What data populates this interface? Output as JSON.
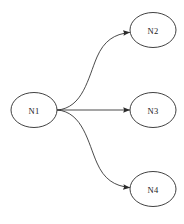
{
  "canvas": {
    "width": 184,
    "height": 224,
    "background_color": "#ffffff"
  },
  "diagram": {
    "type": "directed-graph",
    "stroke_color": "#2b2b2b",
    "label_color": "#1a1a1a",
    "node_fill": "none",
    "nodes": [
      {
        "id": "N1",
        "label": "N1",
        "cx": 34,
        "cy": 110,
        "rx": 23,
        "ry": 17.5
      },
      {
        "id": "N2",
        "label": "N2",
        "cx": 153,
        "cy": 30,
        "rx": 23,
        "ry": 17.5
      },
      {
        "id": "N3",
        "label": "N3",
        "cx": 153,
        "cy": 110,
        "rx": 23,
        "ry": 17.5
      },
      {
        "id": "N4",
        "label": "N4",
        "cx": 153,
        "cy": 189,
        "rx": 23,
        "ry": 17.5
      }
    ],
    "edges": [
      {
        "id": "edge-n1-n2",
        "from": "N1",
        "to": "N2",
        "shape": "curved",
        "path": "M 57.5,110 C 83,108 88,78 97,57 C 104,41 114,34 129.5,32.5",
        "arrow": {
          "x": 130,
          "y": 32.3,
          "angle": -6
        }
      },
      {
        "id": "edge-n1-n3",
        "from": "N1",
        "to": "N3",
        "shape": "straight",
        "path": "M 57.5,110 L 129.5,110",
        "arrow": {
          "x": 130,
          "y": 110,
          "angle": 0
        }
      },
      {
        "id": "edge-n1-n4",
        "from": "N1",
        "to": "N4",
        "shape": "curved",
        "path": "M 57.5,110 C 83,112 88,143 97,163 C 104,179 114,186 129.5,187.5",
        "arrow": {
          "x": 130,
          "y": 187.7,
          "angle": 6
        }
      }
    ]
  }
}
